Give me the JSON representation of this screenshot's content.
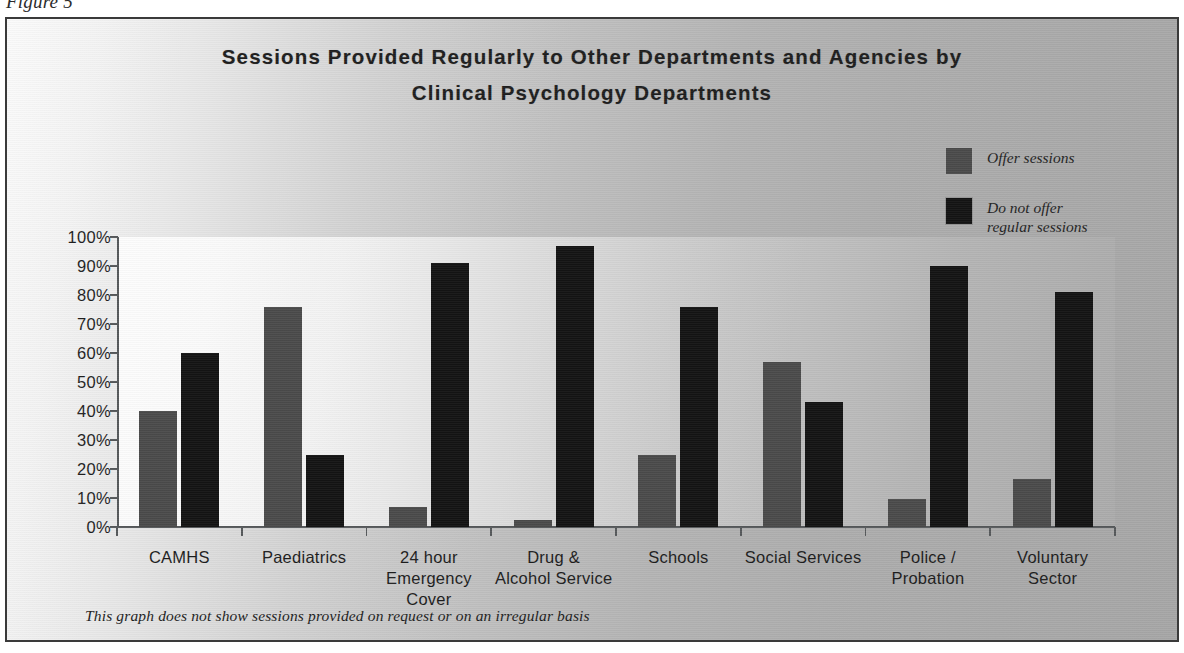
{
  "figure": {
    "caption": "Figure 5",
    "footnote": "This graph does not show sessions provided on request or on an irregular basis"
  },
  "chart_data": {
    "type": "bar",
    "title": "Sessions Provided Regularly to Other Departments and Agencies by Clinical Psychology Departments",
    "title_line1": "Sessions Provided Regularly to Other Departments and Agencies by",
    "title_line2": "Clinical Psychology Departments",
    "xlabel": "",
    "ylabel": "",
    "ylim": [
      0,
      100
    ],
    "ytick_labels": [
      "100%",
      "90%",
      "80%",
      "70%",
      "60%",
      "50%",
      "40%",
      "30%",
      "20%",
      "10%",
      "0%"
    ],
    "ytick_values": [
      100,
      90,
      80,
      70,
      60,
      50,
      40,
      30,
      20,
      10,
      0
    ],
    "grid": false,
    "legend_position": "top-right",
    "categories": [
      "CAMHS",
      "Paediatrics",
      "24 hour\nEmergency\nCover",
      "Drug &\nAlcohol Service",
      "Schools",
      "Social Services",
      "Police /\nProbation",
      "Voluntary\nSector"
    ],
    "series": [
      {
        "name": "Offer sessions",
        "color": "#4a4a4a",
        "values": [
          40,
          76,
          7,
          2.5,
          25,
          57,
          9.5,
          16.5
        ]
      },
      {
        "name": "Do not offer regular sessions or failed to repy",
        "color": "#131313",
        "values": [
          60,
          25,
          91,
          97,
          76,
          43,
          90,
          81
        ]
      }
    ]
  },
  "legend": {
    "items": [
      {
        "label": "Offer sessions",
        "color": "#4a4a4a"
      },
      {
        "label": "Do not offer\nregular sessions\nor failed to repy",
        "color": "#131313"
      }
    ]
  }
}
